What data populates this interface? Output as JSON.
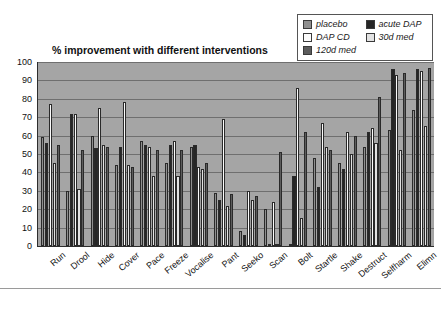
{
  "chart_data": {
    "type": "bar",
    "title": "% improvement with different interventions",
    "xlabel": "",
    "ylabel": "",
    "ylim": [
      0,
      100
    ],
    "yticks": [
      0,
      10,
      20,
      30,
      40,
      50,
      60,
      70,
      80,
      90,
      100
    ],
    "grid": true,
    "legend_position": "top-right",
    "categories": [
      "Run",
      "Drool",
      "Hide",
      "Cover",
      "Pace",
      "Freeze",
      "Vocalise",
      "Pant",
      "Seeko",
      "Scan",
      "Bolt",
      "Startle",
      "Shake",
      "Destruct",
      "Selfharm",
      "Elimn"
    ],
    "series": [
      {
        "name": "placebo",
        "color": "#8f8f8f",
        "values": [
          59,
          30,
          60,
          44,
          57,
          45,
          54,
          29,
          8,
          20,
          0,
          48,
          45,
          54,
          63,
          74
        ]
      },
      {
        "name": "acute DAP",
        "color": "#262626",
        "values": [
          56,
          72,
          53,
          54,
          55,
          55,
          55,
          25,
          6,
          0,
          38,
          32,
          42,
          62,
          96,
          96
        ]
      },
      {
        "name": "DAP CD",
        "color": "#fbfbfb",
        "values": [
          77,
          72,
          75,
          78,
          54,
          57,
          43,
          69,
          30,
          24,
          86,
          67,
          62,
          64,
          93,
          95
        ]
      },
      {
        "name": "30d med",
        "color": "#e2e2e2",
        "values": [
          45,
          31,
          55,
          44,
          38,
          38,
          42,
          22,
          25,
          0,
          15,
          54,
          50,
          56,
          52,
          65
        ]
      },
      {
        "name": "120d med",
        "color": "#5c5c5c",
        "values": [
          55,
          52,
          54,
          43,
          52,
          52,
          45,
          28,
          27,
          51,
          62,
          52,
          60,
          81,
          94,
          97
        ]
      }
    ]
  },
  "legend": {
    "items": [
      {
        "label": "placebo",
        "swatch": "#8f8f8f"
      },
      {
        "label": "acute DAP",
        "swatch": "#262626"
      },
      {
        "label": "DAP CD",
        "swatch": "#fbfbfb"
      },
      {
        "label": "30d med",
        "swatch": "#e2e2e2"
      },
      {
        "label": "120d med",
        "swatch": "#5c5c5c"
      }
    ]
  }
}
